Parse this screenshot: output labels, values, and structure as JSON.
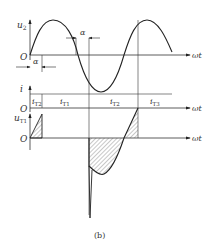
{
  "figure": {
    "caption": "(b)",
    "top_plot": {
      "y_label": "u",
      "y_label_sub": "2",
      "origin_label": "O",
      "x_label": "ωt",
      "alpha_label_1": "α",
      "alpha_label_2": "α"
    },
    "current_plot": {
      "y_label": "i",
      "origin_label": "O",
      "x_label": "ωt",
      "segments": [
        {
          "main": "i",
          "sub": "T2"
        },
        {
          "main": "i",
          "sub": "T1"
        },
        {
          "main": "i",
          "sub": "T2"
        },
        {
          "main": "i",
          "sub": "T3"
        }
      ]
    },
    "voltage_plot": {
      "y_label": "u",
      "y_label_sub": "T1",
      "origin_label": "O",
      "x_label": "ωt"
    }
  }
}
